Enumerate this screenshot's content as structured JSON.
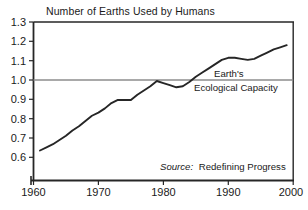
{
  "chart_data": {
    "type": "line",
    "title": "Number of Earths Used by Humans",
    "xlabel": "",
    "ylabel": "",
    "xlim": [
      1960,
      2000
    ],
    "ylim": [
      0.55,
      1.3
    ],
    "grid": false,
    "legend": "none",
    "xticks": [
      "1960",
      "1970",
      "1980",
      "1990",
      "2000"
    ],
    "xtick_values": [
      1960,
      1970,
      1980,
      1990,
      2000
    ],
    "yticks": [
      "1.3",
      "1.2",
      "1.1",
      "1.0",
      "0.9",
      "0.8",
      "0.7",
      "0.6"
    ],
    "ytick_values": [
      1.3,
      1.2,
      1.1,
      1.0,
      0.9,
      0.8,
      0.7,
      0.6
    ],
    "x": [
      1961,
      1962,
      1963,
      1964,
      1965,
      1966,
      1967,
      1968,
      1969,
      1970,
      1971,
      1972,
      1973,
      1974,
      1975,
      1976,
      1977,
      1978,
      1979,
      1980,
      1981,
      1982,
      1983,
      1984,
      1985,
      1986,
      1987,
      1988,
      1989,
      1990,
      1991,
      1992,
      1993,
      1994,
      1995,
      1996,
      1997,
      1998,
      1999
    ],
    "values": [
      0.69,
      0.705,
      0.72,
      0.74,
      0.76,
      0.785,
      0.805,
      0.83,
      0.855,
      0.87,
      0.89,
      0.915,
      0.93,
      0.93,
      0.93,
      0.955,
      0.975,
      0.995,
      1.02,
      1.01,
      1.0,
      0.99,
      0.995,
      1.015,
      1.04,
      1.06,
      1.08,
      1.1,
      1.12,
      1.13,
      1.13,
      1.125,
      1.12,
      1.125,
      1.14,
      1.155,
      1.17,
      1.18,
      1.19
    ],
    "series": [
      {
        "name": "Number of Earths Used by Humans",
        "color": "#262626"
      }
    ],
    "reference_line": {
      "value": 1.0,
      "label_line_1": "Earth's",
      "label_line_2": "Ecological Capacity",
      "color": "#8c8c8c"
    },
    "annotations": {
      "source_prefix": "Source:",
      "source_value": "Redefining Progress"
    }
  },
  "colors": {
    "axis": "#262626",
    "line": "#262626",
    "reference": "#8c8c8c",
    "text": "#1a1a1a",
    "background": "#ffffff"
  }
}
